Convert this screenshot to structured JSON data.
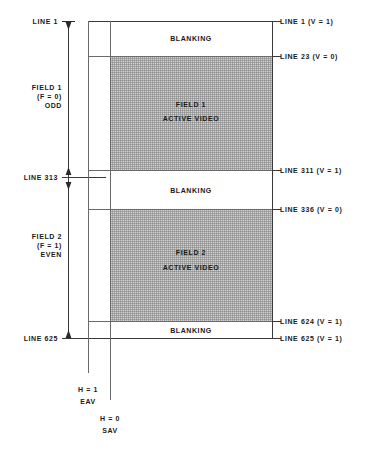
{
  "diagram": {
    "left_labels": [
      {
        "id": "line1",
        "text": "LINE 1"
      },
      {
        "id": "line313",
        "text": "LINE 313"
      },
      {
        "id": "line625",
        "text": "LINE 625"
      }
    ],
    "field_labels": [
      {
        "id": "field1",
        "line1": "FIELD 1",
        "line2": "(F = 0)",
        "line3": "ODD"
      },
      {
        "id": "field2",
        "line1": "FIELD 2",
        "line2": "(F = 1)",
        "line3": "EVEN"
      }
    ],
    "right_labels": [
      {
        "id": "r-line1",
        "text": "LINE 1  (V = 1)"
      },
      {
        "id": "r-line23",
        "text": "LINE 23  (V = 0)"
      },
      {
        "id": "r-line311",
        "text": "LINE 311  (V = 1)"
      },
      {
        "id": "r-line336",
        "text": "LINE 336  (V = 0)"
      },
      {
        "id": "r-line624",
        "text": "LINE 624  (V = 1)"
      },
      {
        "id": "r-line625",
        "text": "LINE 625  (V = 1)"
      }
    ],
    "bands": [
      {
        "id": "blanking-top",
        "text": "BLANKING"
      },
      {
        "id": "active-field1-a",
        "text": "FIELD 1"
      },
      {
        "id": "active-field1-b",
        "text": "ACTIVE  VIDEO"
      },
      {
        "id": "blanking-mid",
        "text": "BLANKING"
      },
      {
        "id": "active-field2-a",
        "text": "FIELD 2"
      },
      {
        "id": "active-field2-b",
        "text": "ACTIVE  VIDEO"
      },
      {
        "id": "blanking-bottom",
        "text": "BLANKING"
      }
    ],
    "bottom_markers": [
      {
        "id": "eav",
        "line1": "H = 1",
        "line2": "EAV"
      },
      {
        "id": "sav",
        "line1": "H = 0",
        "line2": "SAV"
      }
    ],
    "colors": {
      "line": "#3a3a3a",
      "thin_line": "#6a6a6a",
      "active_video_fill": "#d2d2d2",
      "background": "#ffffff",
      "text": "#1a1a1a"
    }
  }
}
